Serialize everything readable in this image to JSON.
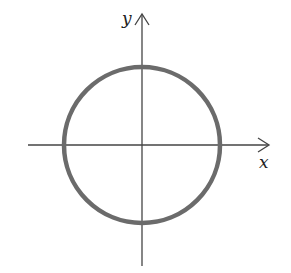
{
  "diagram": {
    "type": "coordinate-plane-circle",
    "axes": {
      "x_label": "x",
      "y_label": "y",
      "color": "#444444"
    },
    "circle": {
      "center": [
        0,
        0
      ],
      "color": "#6b6b6b",
      "description": "circle centered at origin"
    }
  }
}
